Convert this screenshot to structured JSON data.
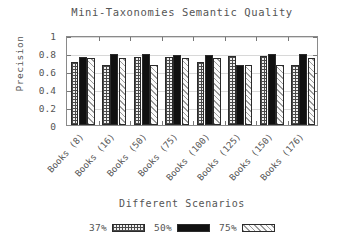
{
  "chart_data": {
    "type": "bar",
    "title": "Mini-Taxonomies Semantic Quality",
    "xlabel": "Different Scenarios",
    "ylabel": "Precision",
    "ylim": [
      0,
      1
    ],
    "yticks": [
      0,
      0.2,
      0.4,
      0.6,
      0.8,
      1
    ],
    "ytick_labels": [
      "0",
      "0.2",
      "0.4",
      "0.6",
      "0.8",
      "1"
    ],
    "grid": true,
    "legend_position": "bottom",
    "categories": [
      "Books (8)",
      "Books (16)",
      "Books (50)",
      "Books (75)",
      "Books (100)",
      "Books (125)",
      "Books (150)",
      "Books (176)"
    ],
    "series": [
      {
        "name": "37%",
        "pattern": "checkered",
        "color": "#efefef",
        "values": [
          0.7,
          0.665,
          0.755,
          0.755,
          0.7,
          0.77,
          0.765,
          0.665
        ]
      },
      {
        "name": "50%",
        "pattern": "solid-black",
        "color": "#111111",
        "values": [
          0.755,
          0.785,
          0.785,
          0.775,
          0.775,
          0.665,
          0.785,
          0.785
        ]
      },
      {
        "name": "75%",
        "pattern": "diagonal-light",
        "color": "#fafafa",
        "values": [
          0.75,
          0.75,
          0.665,
          0.75,
          0.75,
          0.665,
          0.665,
          0.75
        ]
      }
    ]
  },
  "legend": {
    "entries": [
      {
        "label": "37%"
      },
      {
        "label": "50%"
      },
      {
        "label": "75%"
      }
    ]
  }
}
